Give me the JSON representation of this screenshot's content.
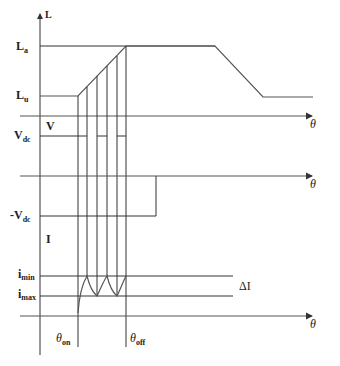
{
  "figure": {
    "stroke_color": "#333333",
    "background": "#ffffff"
  },
  "panels": {
    "inductance": {
      "axis_label": "L",
      "x_axis_label": "θ",
      "upper_level_label": "L",
      "upper_level_sub": "a",
      "lower_level_label": "L",
      "lower_level_sub": "u"
    },
    "voltage": {
      "axis_label": "V",
      "x_axis_label": "θ",
      "pos_level_label": "V",
      "pos_level_sub": "dc",
      "neg_level_label": "-V",
      "neg_level_sub": "dc"
    },
    "current": {
      "axis_label": "I",
      "x_axis_label": "θ",
      "upper_band_label": "i",
      "upper_band_sub": "min",
      "lower_band_label": "i",
      "lower_band_sub": "max",
      "band_label": "ΔI"
    }
  },
  "angles": {
    "on_label": "θ",
    "on_sub": "on",
    "off_label": "θ",
    "off_sub": "off"
  },
  "geometry": {
    "axis_x": 40,
    "theta_on_x": 78,
    "theta_off_x": 126,
    "chop_x": [
      87,
      97,
      107,
      117
    ],
    "L_axis_y": 116,
    "La_y": 46,
    "Lu_y": 96,
    "L_fall_start_x": 215,
    "L_fall_end_x": 263,
    "L_end_x": 313,
    "Vdc_y": 136,
    "V_zero_y": 176,
    "neg_Vdc_y": 216,
    "neg_V_end_x": 156,
    "imin_y": 276,
    "imax_y": 296,
    "I_axis_y": 316,
    "band_end_x": 233
  }
}
